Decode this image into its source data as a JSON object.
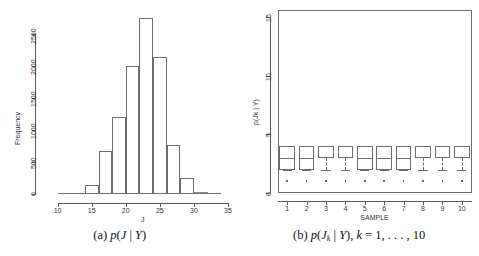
{
  "figure": {
    "panel_a": {
      "caption_prefix": "(a)",
      "caption_math": "p(J | Y)",
      "xlabel": "J",
      "ylabel": "Frequency",
      "xticks": [
        "10",
        "15",
        "20",
        "25",
        "30",
        "35"
      ],
      "yticks": [
        "0",
        "500",
        "1000",
        "1500",
        "2000",
        "2500"
      ]
    },
    "panel_b": {
      "caption_prefix": "(b)",
      "caption_math": "p(Jk | Y), k = 1, . . . , 10",
      "xlabel": "SAMPLE",
      "ylabel": "p(Jk | Y)",
      "xticks": [
        "1",
        "2",
        "3",
        "4",
        "5",
        "6",
        "7",
        "8",
        "9",
        "10"
      ],
      "yticks": [
        "0",
        "5",
        "10",
        "15"
      ]
    }
  },
  "chart_data": [
    {
      "type": "bar",
      "title": "p(J | Y)",
      "subtitle": "(a)",
      "xlabel": "J",
      "ylabel": "Frequency",
      "xlim": [
        8,
        35
      ],
      "ylim": [
        0,
        2850
      ],
      "grid": false,
      "legend": "none",
      "bin_width": 2,
      "bin_edges": [
        10,
        12,
        14,
        16,
        18,
        20,
        22,
        24,
        26,
        28,
        30,
        32,
        34
      ],
      "categories": [
        "10-12",
        "12-14",
        "14-16",
        "16-18",
        "18-20",
        "20-22",
        "22-24",
        "24-26",
        "26-28",
        "28-30",
        "30-32",
        "32-34"
      ],
      "values": [
        5,
        10,
        140,
        670,
        1200,
        2000,
        2750,
        2150,
        760,
        250,
        25,
        5
      ]
    },
    {
      "type": "box",
      "title": "p(Jk | Y), k = 1, ..., 10",
      "subtitle": "(b)",
      "xlabel": "SAMPLE",
      "ylabel": "p(Jk | Y)",
      "xlim": [
        0.5,
        10.5
      ],
      "ylim": [
        0,
        15.6
      ],
      "grid": false,
      "legend": "none",
      "categories": [
        "1",
        "2",
        "3",
        "4",
        "5",
        "6",
        "7",
        "8",
        "9",
        "10"
      ],
      "boxes": [
        {
          "sample": "1",
          "whisker_low": 2,
          "q1": 2,
          "median": 3,
          "q3": 4,
          "whisker_high": 4,
          "outliers": [
            1
          ],
          "median_visible": true
        },
        {
          "sample": "2",
          "whisker_low": 2,
          "q1": 2,
          "median": 3,
          "q3": 4,
          "whisker_high": 4,
          "outliers": [
            1
          ],
          "median_visible": true
        },
        {
          "sample": "3",
          "whisker_low": 2,
          "q1": 3,
          "median": 4,
          "q3": 4,
          "whisker_high": 4,
          "outliers": [
            1
          ],
          "median_visible": false
        },
        {
          "sample": "4",
          "whisker_low": 2,
          "q1": 3,
          "median": 4,
          "q3": 4,
          "whisker_high": 4,
          "outliers": [
            1
          ],
          "median_visible": false
        },
        {
          "sample": "5",
          "whisker_low": 2,
          "q1": 2,
          "median": 3,
          "q3": 4,
          "whisker_high": 4,
          "outliers": [
            1
          ],
          "median_visible": true
        },
        {
          "sample": "6",
          "whisker_low": 2,
          "q1": 2,
          "median": 3,
          "q3": 4,
          "whisker_high": 4,
          "outliers": [
            1
          ],
          "median_visible": true
        },
        {
          "sample": "7",
          "whisker_low": 2,
          "q1": 2,
          "median": 3,
          "q3": 4,
          "whisker_high": 4,
          "outliers": [
            1
          ],
          "median_visible": true
        },
        {
          "sample": "8",
          "whisker_low": 2,
          "q1": 3,
          "median": 4,
          "q3": 4,
          "whisker_high": 4,
          "outliers": [
            1
          ],
          "median_visible": false
        },
        {
          "sample": "9",
          "whisker_low": 2,
          "q1": 3,
          "median": 4,
          "q3": 4,
          "whisker_high": 4,
          "outliers": [
            1
          ],
          "median_visible": false
        },
        {
          "sample": "10",
          "whisker_low": 2,
          "q1": 3,
          "median": 4,
          "q3": 4,
          "whisker_high": 4,
          "outliers": [
            1
          ],
          "median_visible": false
        }
      ]
    }
  ]
}
